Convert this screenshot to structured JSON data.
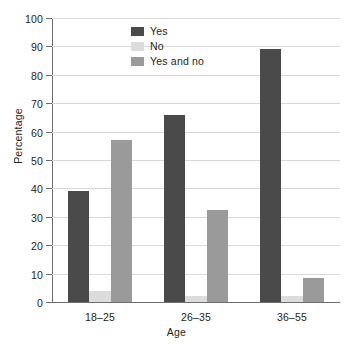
{
  "chart_data": {
    "type": "bar",
    "title": "",
    "subtitle": "",
    "xlabel": "Age",
    "ylabel": "Percentage",
    "categories": [
      "18–25",
      "26–35",
      "36–55"
    ],
    "series": [
      {
        "name": "Yes",
        "values": [
          39,
          66,
          89
        ],
        "color": "#4a4a4a"
      },
      {
        "name": "No",
        "values": [
          4,
          2,
          2
        ],
        "color": "#dcdcdc"
      },
      {
        "name": "Yes and no",
        "values": [
          57,
          32.5,
          8.5
        ],
        "color": "#9a9a9a"
      }
    ],
    "ylim": [
      0,
      100
    ],
    "yticks": [
      0,
      10,
      20,
      30,
      40,
      50,
      60,
      70,
      80,
      90,
      100
    ],
    "ytick_labels": [
      "0",
      "10",
      "20",
      "30",
      "40",
      "50",
      "60",
      "70",
      "80",
      "90",
      "100"
    ],
    "grid": true,
    "grid_axis": "y",
    "legend_position": "upper center",
    "bar_group_gap": 0.34,
    "spines": {
      "left": true,
      "bottom": true,
      "top": false,
      "right": false
    }
  },
  "colors": {
    "axis": "#6d6e71",
    "grid": "#d7d8d9",
    "text": "#231f20",
    "background": "#ffffff"
  }
}
